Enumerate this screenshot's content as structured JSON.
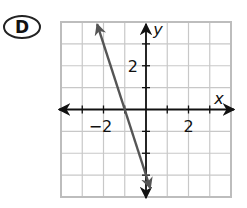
{
  "choice": {
    "label": "D"
  },
  "chart_data": {
    "type": "line",
    "title": "",
    "xlabel": "x",
    "ylabel": "y",
    "xlim": [
      -4,
      4
    ],
    "ylim": [
      -4,
      4
    ],
    "grid": true,
    "x_tick_labels": [
      {
        "value": -2,
        "label": "−2"
      },
      {
        "value": 2,
        "label": "2"
      }
    ],
    "y_tick_labels": [
      {
        "value": 2,
        "label": "2"
      }
    ],
    "series": [
      {
        "name": "line",
        "equation": "y = -3x - 3",
        "slope": -3,
        "intercept": -3,
        "x_intercept": -1,
        "points": [
          [
            -2.3,
            3.9
          ],
          [
            -1,
            0
          ],
          [
            0,
            -3
          ],
          [
            0.2,
            -3.6
          ]
        ],
        "arrows": "both ends",
        "color": "#555555"
      }
    ]
  },
  "colors": {
    "grid": "#c8c8c8",
    "border": "#bdbdbd",
    "axes": "#111111",
    "line": "#555555"
  }
}
